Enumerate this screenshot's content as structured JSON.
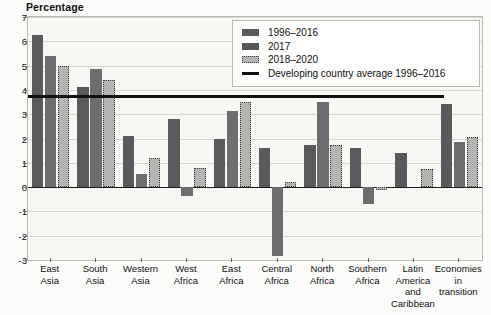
{
  "axis_title": "Percentage",
  "legend": {
    "items": [
      {
        "label": "1996–2016",
        "type": "swatch-dark"
      },
      {
        "label": "2017",
        "type": "swatch-mid"
      },
      {
        "label": "2018–2020",
        "type": "swatch-hatch"
      },
      {
        "label": "Developing country average 1996–2016",
        "type": "line"
      }
    ]
  },
  "colors": {
    "series_1996_2016": "#5a5a5c",
    "series_2017": "#6d6d6f",
    "series_2018_2020": "#b4b4b2",
    "average_line": "#111111",
    "grid": "#d8d8d2",
    "plot_bg": "#f7f7f4"
  },
  "chart_data": {
    "type": "bar",
    "title": "",
    "xlabel": "",
    "ylabel": "Percentage",
    "ylim": [
      -3,
      7
    ],
    "yticks": [
      7,
      6,
      5,
      4,
      3,
      2,
      1,
      0,
      -1,
      -2,
      -3
    ],
    "ytick_labels": [
      "7",
      "6",
      "5",
      "4",
      "3",
      "2",
      "1",
      "0",
      "-1",
      "-2",
      "-3"
    ],
    "grid": true,
    "legend_position": "top-right",
    "categories": [
      "East Asia",
      "South Asia",
      "Western Asia",
      "West Africa",
      "East Africa",
      "Central Africa",
      "North Africa",
      "Southern Africa",
      "Latin America and Caribbean",
      "Economies in transition"
    ],
    "category_lines": [
      [
        "East",
        "Asia"
      ],
      [
        "South",
        "Asia"
      ],
      [
        "Western",
        "Asia"
      ],
      [
        "West",
        "Africa"
      ],
      [
        "East",
        "Africa"
      ],
      [
        "Central",
        "Africa"
      ],
      [
        "North",
        "Africa"
      ],
      [
        "Southern",
        "Africa"
      ],
      [
        "Latin",
        "America",
        "and",
        "Caribbean"
      ],
      [
        "Economies",
        "in",
        "transition"
      ]
    ],
    "series": [
      {
        "name": "1996–2016",
        "values": [
          6.25,
          4.1,
          2.1,
          2.8,
          2.0,
          1.6,
          1.75,
          1.6,
          1.4,
          3.4
        ]
      },
      {
        "name": "2017",
        "values": [
          5.4,
          4.85,
          0.55,
          -0.35,
          3.15,
          -2.85,
          3.5,
          -0.7,
          0.0,
          1.85
        ]
      },
      {
        "name": "2018–2020",
        "values": [
          5.0,
          4.4,
          1.2,
          0.8,
          3.5,
          0.2,
          1.75,
          -0.1,
          0.75,
          2.05
        ]
      }
    ],
    "annotations": [
      {
        "type": "hline",
        "label": "Developing country average 1996–2016",
        "value": 3.72
      }
    ]
  }
}
